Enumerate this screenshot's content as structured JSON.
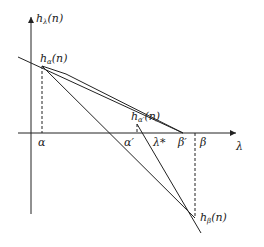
{
  "diagram": {
    "axes": {
      "y_label": "h",
      "y_label_sub": "λ",
      "y_label_arg": "(n)",
      "x_label": "λ"
    },
    "points": {
      "h_alpha": {
        "base": "h",
        "sub": "α",
        "arg": "(n)"
      },
      "h_alpha_prime": {
        "base": "h",
        "sub": "α′",
        "arg": "(n)"
      },
      "h_beta": {
        "base": "h",
        "sub": "β",
        "arg": "(n)"
      }
    },
    "x_ticks": {
      "alpha": "α",
      "alpha_prime": "α′",
      "lambda_star": "λ*",
      "beta_prime": "β′",
      "beta": "β"
    },
    "colors": {
      "line": "#222222",
      "background": "#ffffff"
    }
  }
}
